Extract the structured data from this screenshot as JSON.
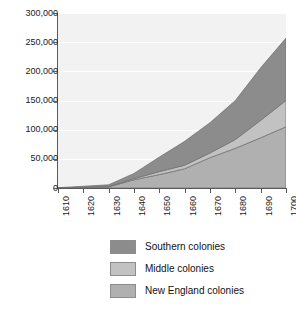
{
  "chart_data": {
    "type": "area",
    "stacked": true,
    "title": "",
    "xlabel": "",
    "ylabel": "",
    "x": [
      1610,
      1620,
      1630,
      1640,
      1650,
      1660,
      1670,
      1680,
      1690,
      1700
    ],
    "categories": [
      "1610",
      "1620",
      "1630",
      "1640",
      "1650",
      "1660",
      "1670",
      "1680",
      "1690",
      "1700"
    ],
    "xlim": [
      1610,
      1700
    ],
    "ylim": [
      0,
      300000
    ],
    "ytick_labels": [
      "0",
      "50,000",
      "100,000",
      "150,000",
      "200,000",
      "250,000",
      "300,000"
    ],
    "ytick_values": [
      0,
      50000,
      100000,
      150000,
      200000,
      250000,
      300000
    ],
    "grid": "horizontal",
    "legend_position": "bottom",
    "plot_background": "#f2f2f2",
    "gridline_color": "#ffffff",
    "axis_color": "#5a5a5a",
    "series": [
      {
        "name": "New England colonies",
        "color": "#b0b0b0",
        "values": [
          0,
          1000,
          2000,
          14000,
          23000,
          33000,
          52000,
          68000,
          86000,
          105000
        ]
      },
      {
        "name": "Middle colonies",
        "color": "#c2c2c2",
        "values": [
          0,
          500,
          500,
          2000,
          5000,
          6000,
          8000,
          15000,
          30000,
          45000
        ]
      },
      {
        "name": "Southern colonies",
        "color": "#8c8c8c",
        "values": [
          500,
          1500,
          3000,
          9000,
          25000,
          41000,
          52000,
          67000,
          90000,
          107000
        ]
      }
    ],
    "totals": [
      500,
      3000,
      5500,
      25000,
      53000,
      80000,
      112000,
      150000,
      206000,
      257000
    ]
  },
  "legend": {
    "items": [
      {
        "label": "Southern colonies",
        "color": "#8c8c8c"
      },
      {
        "label": "Middle colonies",
        "color": "#c2c2c2"
      },
      {
        "label": "New England colonies",
        "color": "#b0b0b0"
      }
    ]
  }
}
